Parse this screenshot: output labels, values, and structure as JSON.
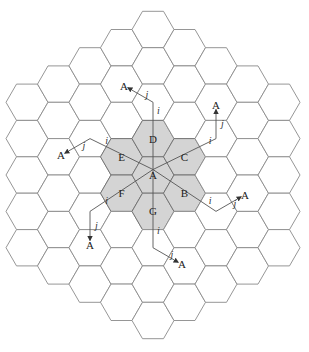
{
  "diagram": {
    "type": "hexagonal-cellular-grid",
    "grid": {
      "center": [
        153,
        175
      ],
      "side": 21,
      "ring_radius": 4,
      "line_color": "#8a8a8a",
      "shaded_fill": "#d4d4d4"
    },
    "cluster": {
      "description": "7-cell reuse cluster",
      "cells": [
        {
          "label": "A",
          "q": 0,
          "r": 0
        },
        {
          "label": "B",
          "q": 1,
          "r": 0
        },
        {
          "label": "C",
          "q": 1,
          "r": -1
        },
        {
          "label": "D",
          "q": 0,
          "r": -1
        },
        {
          "label": "E",
          "q": -1,
          "r": 0
        },
        {
          "label": "F",
          "q": -1,
          "r": 1
        },
        {
          "label": "G",
          "q": 0,
          "r": 1
        }
      ]
    },
    "cochannel_paths": [
      {
        "i_label": "i",
        "j_label": "j",
        "end_label": "A",
        "dir_i": [
          0,
          -2
        ],
        "dir_j": [
          -1,
          0
        ]
      },
      {
        "i_label": "i",
        "j_label": "j",
        "end_label": "A",
        "dir_i": [
          2,
          -2
        ],
        "dir_j": [
          0,
          -1
        ]
      },
      {
        "i_label": "i",
        "j_label": "j",
        "end_label": "A",
        "dir_i": [
          2,
          0
        ],
        "dir_j": [
          1,
          -1
        ]
      },
      {
        "i_label": "i",
        "j_label": "j",
        "end_label": "A",
        "dir_i": [
          0,
          2
        ],
        "dir_j": [
          1,
          0
        ]
      },
      {
        "i_label": "i",
        "j_label": "j",
        "end_label": "A",
        "dir_i": [
          -2,
          2
        ],
        "dir_j": [
          0,
          1
        ]
      },
      {
        "i_label": "i",
        "j_label": "j",
        "end_label": "A",
        "dir_i": [
          -2,
          0
        ],
        "dir_j": [
          -1,
          1
        ]
      }
    ],
    "labels": {
      "i": "i",
      "j": "j",
      "target": "A"
    }
  }
}
